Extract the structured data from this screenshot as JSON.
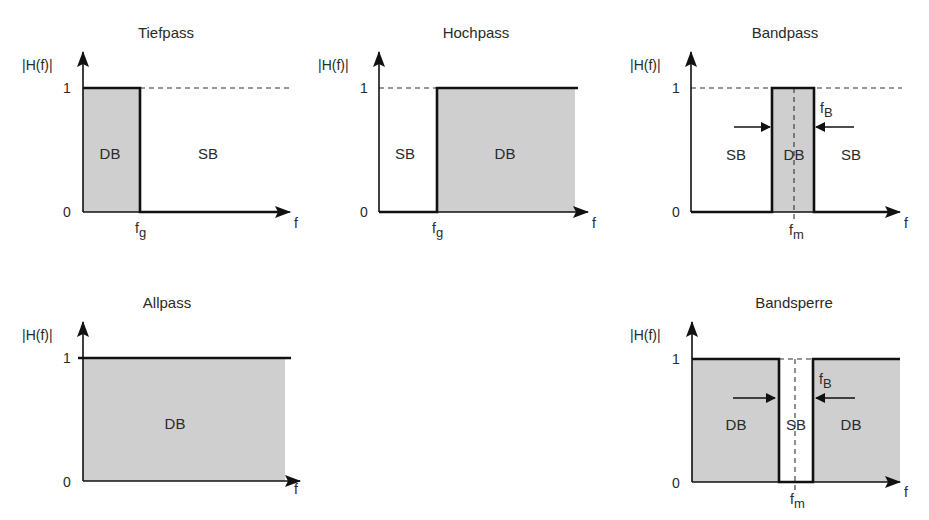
{
  "figure": {
    "y_axis_label": "|H(f)|",
    "x_axis_label": "f",
    "level_one": "1",
    "level_zero": "0",
    "passband_label": "DB",
    "stopband_label": "SB",
    "fill_color": "#cfcfcf",
    "line_color": "#111111"
  },
  "panels": [
    {
      "id": "tiefpass",
      "title": "Tiefpass",
      "cutoff_label": "f",
      "cutoff_sub": "g",
      "regions": [
        "DB",
        "SB"
      ]
    },
    {
      "id": "hochpass",
      "title": "Hochpass",
      "cutoff_label": "f",
      "cutoff_sub": "g",
      "regions": [
        "SB",
        "DB"
      ]
    },
    {
      "id": "bandpass",
      "title": "Bandpass",
      "center_label": "f",
      "center_sub": "m",
      "bandwidth_label": "f",
      "bandwidth_sub": "B",
      "regions": [
        "SB",
        "DB",
        "SB"
      ]
    },
    {
      "id": "allpass",
      "title": "Allpass",
      "regions": [
        "DB"
      ]
    },
    {
      "id": "bandsperre",
      "title": "Bandsperre",
      "center_label": "f",
      "center_sub": "m",
      "bandwidth_label": "f",
      "bandwidth_sub": "B",
      "regions": [
        "DB",
        "SB",
        "DB"
      ]
    }
  ]
}
